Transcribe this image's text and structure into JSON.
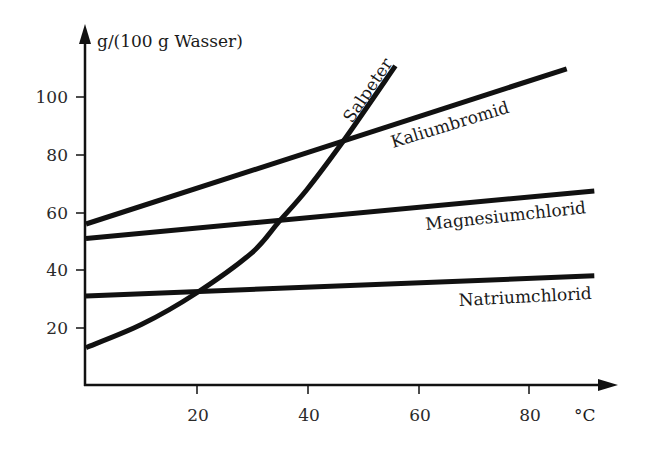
{
  "chart_data": {
    "type": "line",
    "title": "",
    "xlabel": "°C",
    "ylabel": "g/(100 g Wasser)",
    "xlim": [
      0,
      95
    ],
    "ylim": [
      0,
      115
    ],
    "grid": false,
    "legend": "inline labels",
    "x_ticks": [
      20,
      40,
      60,
      80
    ],
    "y_ticks": [
      20,
      40,
      60,
      80,
      100
    ],
    "series": [
      {
        "name": "Kaliumbromid",
        "x": [
          0,
          87
        ],
        "values": [
          56,
          110
        ]
      },
      {
        "name": "Magnesiumchlorid",
        "x": [
          0,
          92
        ],
        "values": [
          51,
          67.5
        ]
      },
      {
        "name": "Natriumchlorid",
        "x": [
          0,
          92
        ],
        "values": [
          31,
          38
        ]
      },
      {
        "name": "Salpeter",
        "x": [
          0,
          10,
          20,
          30,
          35,
          40,
          47,
          56
        ],
        "values": [
          13,
          21,
          32,
          46,
          57,
          68,
          86,
          111
        ]
      }
    ]
  },
  "axes": {
    "y_title": "g/(100 g Wasser)",
    "x_unit": "°C",
    "x_tick_labels": [
      "20",
      "40",
      "60",
      "80"
    ],
    "y_tick_labels": [
      "20",
      "40",
      "60",
      "80",
      "100"
    ]
  },
  "labels": {
    "salpeter": "Salpeter",
    "kaliumbromid": "Kaliumbromid",
    "magnesiumchlorid": "Magnesiumchlorid",
    "natriumchlorid": "Natriumchlorid"
  },
  "colors": {
    "line": "#111111",
    "text": "#1a1a1a"
  }
}
